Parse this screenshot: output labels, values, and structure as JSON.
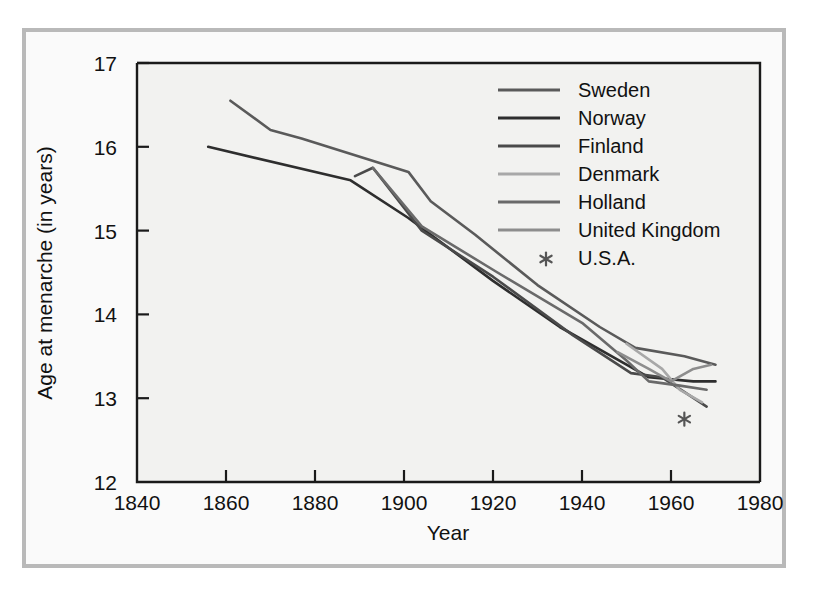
{
  "chart_data": {
    "type": "line",
    "title": "",
    "xlabel": "Year",
    "ylabel": "Age at menarche (in years)",
    "xlim": [
      1840,
      1980
    ],
    "ylim": [
      12,
      17
    ],
    "xticks": [
      1840,
      1860,
      1880,
      1900,
      1920,
      1940,
      1960,
      1980
    ],
    "yticks": [
      12,
      13,
      14,
      15,
      16,
      17
    ],
    "grid": false,
    "legend_position": "top-right",
    "series": [
      {
        "name": "Sweden",
        "color": "#5a5a5a",
        "points": [
          [
            1861,
            16.55
          ],
          [
            1870,
            16.2
          ],
          [
            1877,
            16.1
          ],
          [
            1901,
            15.7
          ],
          [
            1906,
            15.35
          ],
          [
            1916,
            14.95
          ],
          [
            1930,
            14.35
          ],
          [
            1944,
            13.85
          ],
          [
            1952,
            13.6
          ],
          [
            1963,
            13.5
          ],
          [
            1970,
            13.4
          ]
        ]
      },
      {
        "name": "Norway",
        "color": "#2e2e2e",
        "points": [
          [
            1856,
            16.0
          ],
          [
            1888,
            15.6
          ],
          [
            1901,
            15.15
          ],
          [
            1920,
            14.4
          ],
          [
            1935,
            13.85
          ],
          [
            1950,
            13.4
          ],
          [
            1955,
            13.25
          ],
          [
            1965,
            13.2
          ],
          [
            1970,
            13.2
          ]
        ]
      },
      {
        "name": "Finland",
        "color": "#4a4a4a",
        "points": [
          [
            1889,
            15.65
          ],
          [
            1893,
            15.75
          ],
          [
            1904,
            15.0
          ],
          [
            1920,
            14.45
          ],
          [
            1938,
            13.75
          ],
          [
            1951,
            13.3
          ],
          [
            1958,
            13.25
          ],
          [
            1968,
            12.9
          ]
        ]
      },
      {
        "name": "Denmark",
        "color": "#a8a8a8",
        "points": [
          [
            1950,
            13.65
          ],
          [
            1958,
            13.35
          ],
          [
            1962,
            13.1
          ],
          [
            1967,
            12.95
          ]
        ]
      },
      {
        "name": "Holland",
        "color": "#6a6a6a",
        "points": [
          [
            1893,
            15.75
          ],
          [
            1904,
            15.05
          ],
          [
            1921,
            14.5
          ],
          [
            1940,
            13.9
          ],
          [
            1950,
            13.45
          ],
          [
            1955,
            13.2
          ],
          [
            1962,
            13.15
          ],
          [
            1968,
            13.1
          ]
        ]
      },
      {
        "name": "United Kingdom",
        "color": "#8d8d8d",
        "points": [
          [
            1948,
            13.55
          ],
          [
            1955,
            13.35
          ],
          [
            1960,
            13.2
          ],
          [
            1965,
            13.35
          ],
          [
            1969,
            13.4
          ]
        ]
      },
      {
        "name": "U.S.A.",
        "color": "#555555",
        "marker": "asterisk",
        "points": [
          [
            1963,
            12.75
          ]
        ]
      }
    ]
  },
  "axes": {
    "y_title": "Age at menarche (in years)",
    "x_title": "Year",
    "y_tick_labels": [
      "17",
      "16",
      "15",
      "14",
      "13",
      "12"
    ],
    "x_tick_labels": [
      "1840",
      "1860",
      "1880",
      "1900",
      "1920",
      "1940",
      "1960",
      "1980"
    ]
  },
  "legend": {
    "entries": [
      {
        "label": "Sweden",
        "color": "#5a5a5a",
        "marker": "line"
      },
      {
        "label": "Norway",
        "color": "#2e2e2e",
        "marker": "line"
      },
      {
        "label": "Finland",
        "color": "#4a4a4a",
        "marker": "line"
      },
      {
        "label": "Denmark",
        "color": "#a8a8a8",
        "marker": "line"
      },
      {
        "label": "Holland",
        "color": "#6a6a6a",
        "marker": "line"
      },
      {
        "label": "United Kingdom",
        "color": "#8d8d8d",
        "marker": "line"
      },
      {
        "label": "U.S.A.",
        "color": "#555555",
        "marker": "asterisk"
      }
    ]
  }
}
